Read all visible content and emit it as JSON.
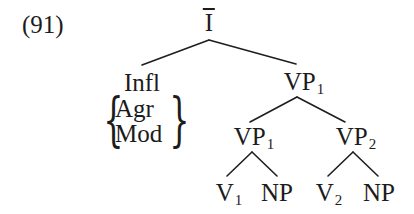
{
  "example_number": "(91)",
  "tree": {
    "root": {
      "label": "I",
      "bar": true
    },
    "infl": {
      "label": "Infl",
      "features": [
        "Agr",
        "Mod"
      ]
    },
    "vp_top": {
      "label": "VP",
      "sub": "1"
    },
    "vp_lower_left": {
      "label": "VP",
      "sub": "1"
    },
    "vp_lower_right": {
      "label": "VP",
      "sub": "2"
    },
    "leaves": [
      {
        "label": "V",
        "sub": "1"
      },
      {
        "label": "NP",
        "sub": ""
      },
      {
        "label": "V",
        "sub": "2"
      },
      {
        "label": "NP",
        "sub": ""
      }
    ]
  },
  "colors": {
    "ink": "#1c1c1c",
    "background": "#ffffff"
  }
}
